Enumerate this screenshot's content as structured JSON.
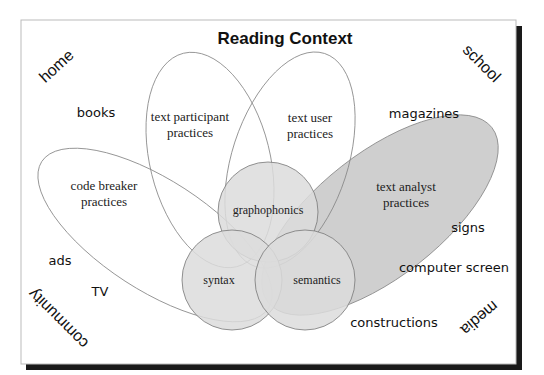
{
  "title": "Reading Context",
  "contexts": {
    "home": "home",
    "school": "school",
    "community": "community",
    "media": "media"
  },
  "texts": {
    "books": "books",
    "magazines": "magazines",
    "ads": "ads",
    "tv": "TV",
    "signs": "signs",
    "computer_screen": "computer screen",
    "constructions": "constructions"
  },
  "practices": {
    "code_breaker": [
      "code breaker",
      "practices"
    ],
    "text_participant": [
      "text participant",
      "practices"
    ],
    "text_user": [
      "text user",
      "practices"
    ],
    "text_analyst": [
      "text analyst",
      "practices"
    ]
  },
  "cueing_systems": {
    "graphophonics": "graphophonics",
    "syntax": "syntax",
    "semantics": "semantics"
  },
  "colors": {
    "frame_shadow": "#1a1a1a",
    "circle_fill": "#dcdcdc",
    "analyst_fill": "#cfcfcf",
    "outline": "#777777"
  }
}
